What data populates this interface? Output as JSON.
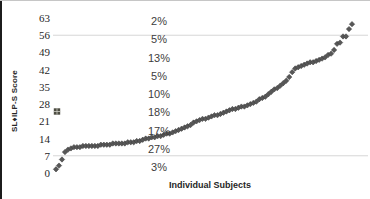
{
  "window": {
    "background_color": "#ffffff",
    "left_border_color": "#1c1c1c",
    "top_border_color": "#c6c6c6"
  },
  "chart_data": {
    "type": "scatter",
    "title": "",
    "xlabel": "Individual Subjects",
    "ylabel": "SL♦ILP-S Score",
    "ylim": [
      0,
      63
    ],
    "y_ticks": [
      63,
      56,
      49,
      42,
      35,
      28,
      21,
      14,
      7,
      0
    ],
    "gridlines_y": [
      56,
      7
    ],
    "legend_position": "none",
    "n_subjects": 100,
    "marker_color": "#575757",
    "marker_shape": "diamond",
    "series": [
      {
        "name": "SL♦ILP-S scores by individual subject (sorted ascending)",
        "marker": "diamond",
        "color": "#575757",
        "values": [
          1.5,
          3,
          5.5,
          8.5,
          9.5,
          10,
          10.5,
          10.5,
          10.5,
          11,
          11,
          11,
          11,
          11,
          11,
          11.5,
          11.5,
          11.5,
          11.5,
          12,
          12,
          12,
          12,
          12,
          12.5,
          12.5,
          12.5,
          13,
          13,
          13.5,
          14,
          14,
          14.5,
          14.5,
          15,
          15,
          15.5,
          16,
          16,
          16.5,
          17,
          17.5,
          18,
          18.5,
          19,
          19.5,
          20.5,
          21,
          21.5,
          22,
          22,
          22.5,
          23,
          23.5,
          23.5,
          24,
          24.5,
          25,
          25.5,
          26,
          26,
          26.5,
          27,
          27,
          27.5,
          28,
          28.5,
          29,
          30,
          30.5,
          31,
          32,
          33,
          34,
          34.5,
          35.5,
          36.5,
          37.5,
          39,
          41,
          42.5,
          43,
          43.5,
          44,
          44.5,
          45,
          45,
          45.5,
          46,
          46.5,
          47,
          48,
          48.5,
          50,
          52.5,
          53,
          55.5,
          55.5,
          58.5,
          60.5
        ]
      },
      {
        "name": "single square-marker point",
        "marker": "square",
        "color": "#4c4c41",
        "points": [
          {
            "x_index": 0,
            "y": 25
          }
        ]
      }
    ],
    "annotations": {
      "percent_labels": [
        "2%",
        "5%",
        "13%",
        "5%",
        "10%",
        "18%",
        "17%",
        "27%",
        "3%"
      ],
      "note": "percent of subjects per 7-point score band, listed top band (56-63) to bottom band (0-7); sums to 100%"
    }
  }
}
